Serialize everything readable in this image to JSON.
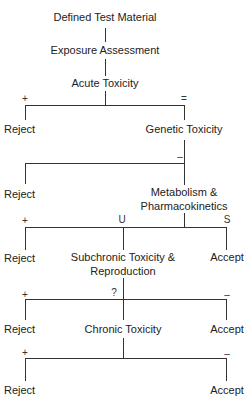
{
  "diagram": {
    "type": "decision-tree",
    "nodes": {
      "defined_test_material": "Defined Test Material",
      "exposure_assessment": "Exposure Assessment",
      "acute_toxicity": "Acute Toxicity",
      "genetic_toxicity": "Genetic Toxicity",
      "metabolism_line1": "Metabolism &",
      "metabolism_line2": "Pharmacokinetics",
      "subchronic_line1": "Subchronic Toxicity &",
      "subchronic_line2": "Reproduction",
      "chronic_toxicity": "Chronic Toxicity"
    },
    "outcomes": {
      "reject": "Reject",
      "accept": "Accept"
    },
    "branch_labels": {
      "acute_positive": "+",
      "acute_negative": "=",
      "genetic_negative": "–",
      "metabolism_positive": "+",
      "metabolism_unsafe": "U",
      "metabolism_safe": "S",
      "subchronic_positive": "+",
      "subchronic_uncertain": "?",
      "subchronic_negative": "–",
      "chronic_positive": "+",
      "chronic_negative": "–"
    }
  }
}
